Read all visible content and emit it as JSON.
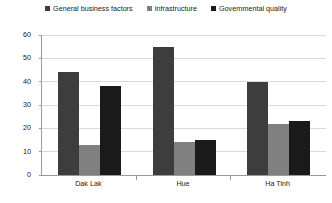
{
  "chart_data": {
    "type": "bar",
    "title": "",
    "subtitle": "",
    "xlabel": "",
    "ylabel": "",
    "categories": [
      "Dak Lak",
      "Hue",
      "Ha Tinh"
    ],
    "series": [
      {
        "name": "General business factors",
        "color": "#3d3d3d",
        "values": [
          44,
          55,
          40
        ]
      },
      {
        "name": "Infrastructure",
        "color": "#808080",
        "values": [
          13,
          14,
          22
        ]
      },
      {
        "name": "Governmental quality",
        "color": "#1a1a1a",
        "values": [
          38,
          15,
          23
        ]
      }
    ],
    "ylim": [
      0,
      60
    ],
    "yticks": [
      0,
      10,
      20,
      30,
      40,
      50,
      60
    ],
    "ytick_labels": [
      "0",
      "10",
      "20",
      "30",
      "40",
      "50",
      "60"
    ],
    "grid": true,
    "grid_axis": "y",
    "legend_position": "top",
    "background_color": "#ffffff",
    "grid_color": "#d9d9d9",
    "axis_color": "#9a9a9a"
  }
}
